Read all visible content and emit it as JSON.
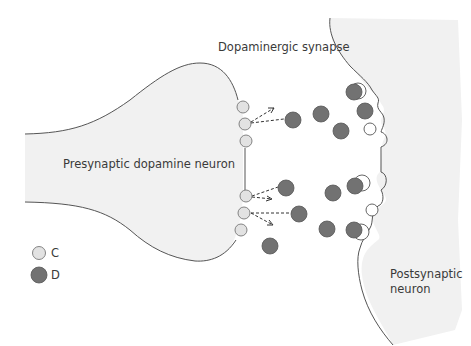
{
  "diagram": {
    "title": "Dopaminergic synapse",
    "presynaptic_label": "Presynaptic dopamine neuron",
    "postsynaptic_label_line1": "Postsynaptic",
    "postsynaptic_label_line2": "neuron",
    "legend": [
      {
        "symbol": "light-circle",
        "label": "C",
        "color": "#e2e2e2"
      },
      {
        "symbol": "dark-circle",
        "label": "D",
        "color": "#727272"
      }
    ],
    "colors": {
      "membrane_fill": "#f1f1f1",
      "outline": "#555555",
      "vesicle_c": "#e2e2e2",
      "molecule_d": "#727272",
      "text": "#3a3a3a"
    }
  }
}
